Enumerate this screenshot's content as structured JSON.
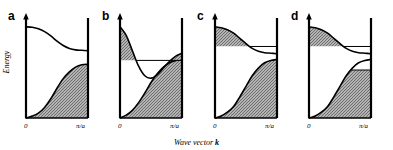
{
  "figure": {
    "axes": {
      "ylabel": "Energy",
      "xlabel_prefix": "Wave vector ",
      "xlabel_symbol": "k",
      "tick_left": "0",
      "tick_right": "π/a",
      "ylim": [
        0,
        1
      ],
      "xlim": [
        0,
        1
      ]
    },
    "style": {
      "line_color": "#000000",
      "fill_color": "#6e6e6e",
      "background": "#ffffff",
      "axis_width": 2.2
    },
    "panels": [
      {
        "letter": "a",
        "name": "insulator",
        "description": "Large band gap; valence band completely filled, conduction band completely empty.",
        "lower_band": [
          0.0,
          0.02,
          0.05,
          0.11,
          0.2,
          0.31,
          0.41,
          0.48,
          0.53,
          0.555,
          0.56
        ],
        "upper_band": [
          0.95,
          0.945,
          0.93,
          0.9,
          0.855,
          0.8,
          0.755,
          0.725,
          0.71,
          0.705,
          0.7
        ],
        "lower_fill_level": 1.0,
        "upper_fill_level": 0.0,
        "gap_at_zone_edge": 0.14
      },
      {
        "letter": "b",
        "name": "semimetal-overlap",
        "description": "Conduction band minimum dips below valence band maximum; bands overlap, both partially filled.",
        "lower_band": [
          0.0,
          0.03,
          0.08,
          0.16,
          0.26,
          0.37,
          0.46,
          0.53,
          0.575,
          0.6,
          0.61
        ],
        "upper_band": [
          0.95,
          0.86,
          0.7,
          0.54,
          0.44,
          0.415,
          0.45,
          0.52,
          0.59,
          0.645,
          0.675
        ],
        "lower_fill_level": 0.6,
        "upper_fill_level": 0.6,
        "gap_at_zone_edge": 0.065
      },
      {
        "letter": "c",
        "name": "semiconductor-n-type",
        "description": "Small gap; valence band full, electrons occupy bottom of conduction band near zone edge.",
        "lower_band": [
          0.0,
          0.02,
          0.06,
          0.12,
          0.22,
          0.33,
          0.44,
          0.52,
          0.575,
          0.6,
          0.61
        ],
        "upper_band": [
          0.95,
          0.94,
          0.92,
          0.885,
          0.83,
          0.775,
          0.725,
          0.695,
          0.68,
          0.675,
          0.67
        ],
        "lower_fill_level": 1.0,
        "upper_fill_level": 0.745,
        "gap_at_zone_edge": 0.06
      },
      {
        "letter": "d",
        "name": "metal-partial-filling",
        "description": "Electrons in conduction band near zone edge and holes at top of valence band; both bands partly filled.",
        "lower_band": [
          0.0,
          0.02,
          0.06,
          0.12,
          0.22,
          0.33,
          0.44,
          0.52,
          0.575,
          0.6,
          0.61
        ],
        "upper_band": [
          0.95,
          0.94,
          0.92,
          0.885,
          0.83,
          0.775,
          0.725,
          0.695,
          0.68,
          0.675,
          0.67
        ],
        "lower_fill_level": 0.5,
        "upper_fill_level": 0.745,
        "gap_at_zone_edge": 0.06
      }
    ]
  }
}
